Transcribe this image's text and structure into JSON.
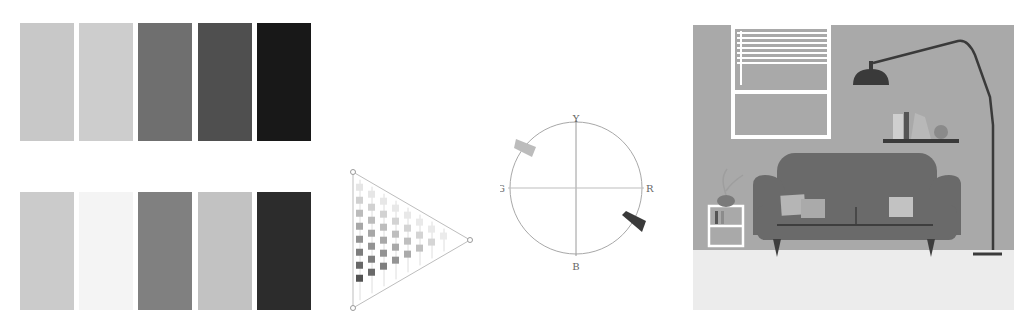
{
  "figure": {
    "swatches": {
      "top_row": [
        {
          "color": "#c8c8c8"
        },
        {
          "color": "#cdcdcd"
        },
        {
          "color": "#6f6f6f"
        },
        {
          "color": "#4f4f4f"
        },
        {
          "color": "#181818"
        }
      ],
      "bottom_row": [
        {
          "color": "#cbcbcb"
        },
        {
          "color": "#f4f4f4"
        },
        {
          "color": "#808080"
        },
        {
          "color": "#c2c2c2"
        },
        {
          "color": "#2c2c2c"
        }
      ]
    },
    "triangle_diagram": {
      "line_color": "#bdbdbd",
      "vertex_marker": "circle"
    },
    "color_wheel": {
      "labels": {
        "top": "Y",
        "left": "G",
        "right": "R",
        "bottom": "B"
      },
      "markers": [
        {
          "name": "light-sample",
          "color": "#bcbcbc",
          "angle_deg": 145
        },
        {
          "name": "dark-sample",
          "color": "#3a3a3a",
          "angle_deg": -25
        }
      ]
    },
    "room_scene": {
      "wall_color": "#a9a9a9",
      "floor_color": "#ececec",
      "sofa_color": "#6a6a6a",
      "lamp_color": "#3a3a3a"
    }
  }
}
